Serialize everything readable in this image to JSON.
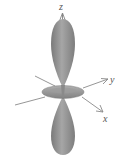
{
  "diagram": {
    "type": "orbital-dz2",
    "axes": {
      "z": {
        "label": "z"
      },
      "y": {
        "label": "y"
      },
      "x": {
        "label": "x"
      }
    },
    "colors": {
      "lobe": "#8c8c8c",
      "lobe_highlight": "#a8a8a8",
      "ring": "#9a9a9a",
      "axis": "#7f7f7f",
      "label": "#555555"
    }
  }
}
